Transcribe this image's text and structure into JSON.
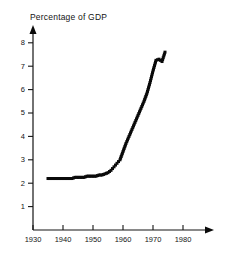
{
  "chart_data": {
    "type": "line",
    "title": "Percentage of GDP",
    "xlabel": "",
    "ylabel": "",
    "xlim": [
      1930,
      1982
    ],
    "ylim": [
      0,
      8.4
    ],
    "xticks": [
      1930,
      1940,
      1950,
      1960,
      1970,
      1980
    ],
    "xtick_labels": [
      "1930",
      "1940",
      "1950",
      "1960",
      "1970",
      "1980"
    ],
    "yticks": [
      1,
      2,
      3,
      4,
      5,
      6,
      7,
      8
    ],
    "ytick_labels": [
      "1",
      "2",
      "3",
      "4",
      "5",
      "6",
      "7",
      "8"
    ],
    "grid": false,
    "legend": "none",
    "marker": "square",
    "series": [
      {
        "name": "Percentage of GDP",
        "x": [
          1935,
          1936,
          1937,
          1938,
          1939,
          1940,
          1941,
          1942,
          1943,
          1944,
          1945,
          1946,
          1947,
          1948,
          1949,
          1950,
          1951,
          1952,
          1953,
          1954,
          1955,
          1956,
          1957,
          1958,
          1959,
          1960,
          1961,
          1962,
          1963,
          1964,
          1965,
          1966,
          1967,
          1968,
          1969,
          1970,
          1971,
          1972,
          1973,
          1974
        ],
        "values": [
          2.2,
          2.2,
          2.2,
          2.2,
          2.2,
          2.2,
          2.2,
          2.2,
          2.2,
          2.25,
          2.25,
          2.25,
          2.25,
          2.3,
          2.3,
          2.3,
          2.3,
          2.35,
          2.35,
          2.4,
          2.45,
          2.55,
          2.7,
          2.85,
          3.0,
          3.35,
          3.7,
          4.0,
          4.3,
          4.6,
          4.9,
          5.2,
          5.5,
          5.85,
          6.3,
          6.8,
          7.25,
          7.3,
          7.2,
          7.6
        ]
      }
    ]
  }
}
